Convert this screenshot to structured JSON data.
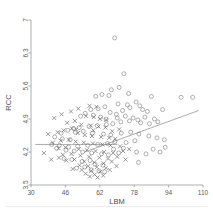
{
  "chart_data": {
    "type": "scatter",
    "title": "",
    "xlabel": "LBM",
    "ylabel": "RCC",
    "xlim": [
      30,
      110
    ],
    "ylim": [
      3.5,
      7
    ],
    "xticks": [
      30,
      46,
      62,
      78,
      94,
      110
    ],
    "yticks": [
      3.5,
      4.2,
      4.9,
      5.6,
      6.3,
      7
    ],
    "grid": false,
    "legend": "none",
    "marker_colors": {
      "circle": "#7a7a7a",
      "cross": "#6e6e6e",
      "line": "#8a8a8a"
    },
    "series": [
      {
        "name": "circle-group",
        "marker": "circle",
        "points": [
          [
            68.9,
            6.62
          ],
          [
            73.2,
            5.86
          ],
          [
            67.4,
            5.52
          ],
          [
            71.0,
            5.57
          ],
          [
            75.4,
            5.44
          ],
          [
            63.0,
            5.42
          ],
          [
            60.1,
            5.38
          ],
          [
            66.2,
            5.4
          ],
          [
            86.0,
            5.38
          ],
          [
            99.8,
            5.36
          ],
          [
            105.2,
            5.36
          ],
          [
            70.5,
            5.22
          ],
          [
            74.8,
            5.2
          ],
          [
            78.9,
            5.26
          ],
          [
            80.6,
            5.18
          ],
          [
            64.4,
            5.16
          ],
          [
            57.8,
            5.1
          ],
          [
            61.2,
            5.12
          ],
          [
            72.6,
            5.08
          ],
          [
            76.0,
            5.14
          ],
          [
            81.9,
            5.1
          ],
          [
            84.1,
            5.06
          ],
          [
            66.8,
            5.04
          ],
          [
            69.7,
            5.0
          ],
          [
            59.0,
            4.98
          ],
          [
            55.2,
            5.02
          ],
          [
            53.1,
            4.96
          ],
          [
            62.4,
            4.94
          ],
          [
            64.9,
            4.9
          ],
          [
            70.1,
            4.92
          ],
          [
            73.9,
            4.96
          ],
          [
            77.5,
            4.92
          ],
          [
            79.7,
            4.88
          ],
          [
            83.0,
            4.94
          ],
          [
            87.4,
            4.9
          ],
          [
            91.2,
            5.1
          ],
          [
            89.0,
            4.84
          ],
          [
            85.1,
            4.8
          ],
          [
            81.0,
            4.82
          ],
          [
            75.8,
            4.86
          ],
          [
            71.8,
            4.84
          ],
          [
            68.0,
            4.8
          ],
          [
            65.1,
            4.78
          ],
          [
            60.8,
            4.76
          ],
          [
            57.0,
            4.74
          ],
          [
            52.4,
            4.72
          ],
          [
            49.8,
            4.7
          ],
          [
            47.1,
            4.66
          ],
          [
            44.0,
            4.6
          ],
          [
            50.6,
            4.62
          ],
          [
            54.3,
            4.64
          ],
          [
            58.6,
            4.6
          ],
          [
            63.7,
            4.58
          ],
          [
            67.1,
            4.56
          ],
          [
            72.0,
            4.6
          ],
          [
            76.4,
            4.62
          ],
          [
            80.2,
            4.58
          ],
          [
            84.8,
            4.54
          ],
          [
            88.6,
            4.5
          ],
          [
            92.0,
            4.46
          ],
          [
            78.3,
            4.44
          ],
          [
            74.2,
            4.4
          ],
          [
            69.0,
            4.42
          ],
          [
            65.6,
            4.38
          ],
          [
            61.0,
            4.36
          ],
          [
            56.4,
            4.34
          ],
          [
            51.7,
            4.32
          ],
          [
            47.5,
            4.3
          ],
          [
            43.2,
            4.34
          ],
          [
            39.6,
            4.36
          ],
          [
            42.0,
            4.28
          ],
          [
            46.3,
            4.24
          ],
          [
            50.1,
            4.22
          ],
          [
            54.0,
            4.2
          ],
          [
            58.2,
            4.18
          ],
          [
            62.8,
            4.16
          ],
          [
            66.0,
            4.14
          ],
          [
            70.8,
            4.18
          ],
          [
            79.1,
            4.2
          ],
          [
            83.5,
            4.16
          ],
          [
            92.4,
            4.3
          ],
          [
            80.0,
            3.98
          ],
          [
            57.5,
            4.02
          ],
          [
            53.8,
            4.0
          ],
          [
            49.0,
            4.04
          ],
          [
            45.4,
            4.06
          ],
          [
            59.8,
            3.94
          ],
          [
            63.4,
            3.92
          ],
          [
            55.0,
            3.88
          ],
          [
            51.2,
            3.86
          ],
          [
            58.0,
            3.82
          ],
          [
            61.6,
            3.8
          ],
          [
            64.2,
            3.78
          ],
          [
            48.2,
            4.46
          ],
          [
            44.6,
            4.48
          ],
          [
            41.0,
            4.52
          ],
          [
            86.8,
            4.26
          ],
          [
            90.0,
            4.2
          ],
          [
            73.0,
            4.28
          ],
          [
            68.4,
            4.26
          ]
        ]
      },
      {
        "name": "cross-group",
        "marker": "cross",
        "points": [
          [
            57.2,
            5.18
          ],
          [
            60.4,
            5.16
          ],
          [
            52.0,
            5.12
          ],
          [
            48.6,
            5.06
          ],
          [
            44.2,
            5.0
          ],
          [
            40.8,
            4.92
          ],
          [
            55.6,
            4.96
          ],
          [
            59.2,
            4.94
          ],
          [
            62.0,
            4.9
          ],
          [
            65.0,
            4.88
          ],
          [
            50.4,
            4.86
          ],
          [
            46.8,
            4.82
          ],
          [
            53.4,
            4.78
          ],
          [
            57.8,
            4.76
          ],
          [
            61.4,
            4.74
          ],
          [
            64.6,
            4.72
          ],
          [
            49.0,
            4.7
          ],
          [
            45.2,
            4.66
          ],
          [
            42.4,
            4.62
          ],
          [
            38.0,
            4.58
          ],
          [
            51.8,
            4.6
          ],
          [
            55.0,
            4.56
          ],
          [
            58.4,
            4.54
          ],
          [
            62.6,
            4.52
          ],
          [
            66.4,
            4.5
          ],
          [
            69.2,
            4.48
          ],
          [
            47.6,
            4.46
          ],
          [
            43.8,
            4.44
          ],
          [
            40.2,
            4.4
          ],
          [
            36.0,
            4.18
          ],
          [
            50.8,
            4.42
          ],
          [
            54.6,
            4.4
          ],
          [
            58.8,
            4.38
          ],
          [
            63.2,
            4.36
          ],
          [
            67.0,
            4.34
          ],
          [
            71.4,
            4.32
          ],
          [
            46.0,
            4.3
          ],
          [
            42.8,
            4.28
          ],
          [
            52.2,
            4.26
          ],
          [
            56.0,
            4.24
          ],
          [
            60.0,
            4.22
          ],
          [
            64.0,
            4.2
          ],
          [
            68.2,
            4.18
          ],
          [
            72.8,
            4.22
          ],
          [
            48.8,
            4.16
          ],
          [
            44.8,
            4.14
          ],
          [
            53.0,
            4.12
          ],
          [
            57.0,
            4.1
          ],
          [
            61.8,
            4.08
          ],
          [
            65.8,
            4.06
          ],
          [
            70.0,
            4.1
          ],
          [
            50.2,
            4.04
          ],
          [
            46.4,
            4.02
          ],
          [
            54.8,
            4.0
          ],
          [
            59.4,
            3.98
          ],
          [
            63.8,
            3.96
          ],
          [
            67.6,
            4.0
          ],
          [
            52.6,
            3.92
          ],
          [
            56.6,
            3.9
          ],
          [
            60.6,
            3.88
          ],
          [
            64.8,
            3.86
          ],
          [
            49.4,
            3.84
          ],
          [
            53.6,
            3.82
          ],
          [
            58.0,
            3.8
          ],
          [
            62.2,
            3.78
          ],
          [
            66.6,
            3.82
          ],
          [
            55.4,
            3.74
          ],
          [
            59.6,
            3.72
          ],
          [
            63.6,
            3.7
          ],
          [
            57.4,
            3.68
          ],
          [
            61.0,
            3.66
          ],
          [
            69.8,
            3.9
          ],
          [
            74.0,
            4.04
          ],
          [
            43.0,
            4.08
          ],
          [
            39.4,
            4.04
          ],
          [
            75.6,
            4.26
          ],
          [
            51.0,
            4.68
          ],
          [
            59.0,
            4.66
          ],
          [
            67.8,
            4.64
          ],
          [
            71.0,
            4.68
          ]
        ]
      }
    ],
    "fit_lines": [
      {
        "name": "flat-line",
        "x0": 32.0,
        "y0": 4.36,
        "x1": 70.0,
        "y1": 4.36
      },
      {
        "name": "rising-line",
        "x0": 55.0,
        "y0": 4.2,
        "x1": 108.0,
        "y1": 5.08
      }
    ]
  },
  "caption": ""
}
